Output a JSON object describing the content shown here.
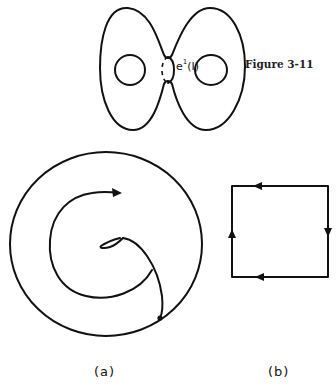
{
  "caption": "Figure 3-11",
  "top_figure": {
    "description": "Genus-2 surface (double torus) with separating curve at the neck",
    "curve_label": {
      "base": "e",
      "superscript": "1",
      "argument": "(I)"
    }
  },
  "panels": [
    {
      "id": "a",
      "label": "(a)",
      "description": "Disk boundary circle with spiral arc ending in arrow; inner curve with small loop connecting to a point on boundary"
    },
    {
      "id": "b",
      "label": "(b)",
      "description": "Square with oriented edges",
      "edge_arrows": {
        "top": "left",
        "right": "down",
        "bottom": "left",
        "left": "up"
      }
    }
  ],
  "colors": {
    "ink": "#111111",
    "background": "#ffffff"
  }
}
